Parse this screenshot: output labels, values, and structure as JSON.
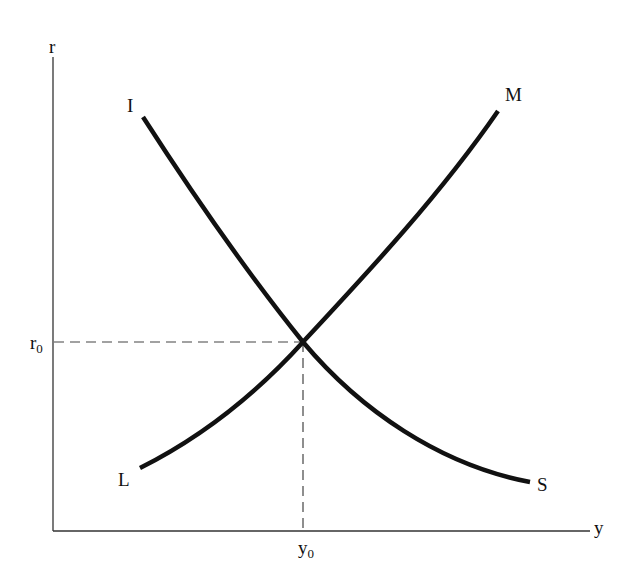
{
  "diagram": {
    "type": "IS-LM",
    "axes": {
      "y_axis_label": "r",
      "x_axis_label": "y"
    },
    "curves": [
      {
        "name": "IS",
        "start_label": "I",
        "end_label": "S",
        "slope": "downward"
      },
      {
        "name": "LM",
        "start_label": "L",
        "end_label": "M",
        "slope": "upward"
      }
    ],
    "equilibrium": {
      "r_label_base": "r",
      "r_label_sub": "0",
      "y_label_base": "y",
      "y_label_sub": "0"
    },
    "colors": {
      "curve": "#111111",
      "axis": "#333333",
      "guide": "#444444",
      "background": "#ffffff"
    }
  }
}
